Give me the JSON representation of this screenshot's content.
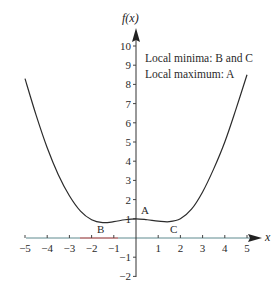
{
  "chart_data": {
    "type": "line",
    "title": "",
    "xlabel": "x",
    "ylabel": "f(x)",
    "xlim": [
      -5,
      5
    ],
    "ylim": [
      -2,
      10
    ],
    "grid": false,
    "x_ticks": [
      -5,
      -4,
      -3,
      -2,
      -1,
      1,
      2,
      3,
      4,
      5
    ],
    "x_tick_labels": [
      "−5",
      "−4",
      "−3",
      "−2",
      "−1",
      "1",
      "2",
      "3",
      "4",
      "5"
    ],
    "y_ticks": [
      -2,
      -1,
      1,
      2,
      3,
      4,
      5,
      6,
      7,
      8,
      9,
      10
    ],
    "y_tick_labels": [
      "−2",
      "−1",
      "1",
      "2",
      "3",
      "4",
      "5",
      "6",
      "7",
      "8",
      "9",
      "10"
    ],
    "series": [
      {
        "name": "f(x)",
        "x": [
          -5,
          -4.5,
          -4,
          -3.5,
          -3,
          -2.5,
          -2,
          -1.5,
          -1,
          -0.5,
          0,
          0.5,
          1,
          1.5,
          2,
          2.5,
          3,
          3.5,
          4,
          4.5,
          5
        ],
        "y": [
          8.3,
          6.4,
          4.7,
          3.3,
          2.2,
          1.4,
          0.95,
          0.8,
          0.85,
          0.95,
          1.0,
          0.95,
          0.88,
          0.85,
          1.0,
          1.5,
          2.4,
          3.6,
          5.0,
          6.7,
          8.5
        ]
      }
    ],
    "points": [
      {
        "label": "A",
        "x": 0,
        "y": 1,
        "type": "local maximum"
      },
      {
        "label": "B",
        "x": -1.5,
        "y": 0.8,
        "type": "local minimum"
      },
      {
        "label": "C",
        "x": 1.5,
        "y": 0.85,
        "type": "local minimum"
      }
    ],
    "annotations": [
      "Local minima: B and C",
      "Local maximum: A"
    ]
  },
  "labels": {
    "y_axis": "f(x)",
    "x_axis": "x",
    "note_line1": "Local minima: B and C",
    "note_line2": "Local maximum: A",
    "point_a": "A",
    "point_b": "B",
    "point_c": "C"
  },
  "colors": {
    "curve": "#2b2b2b",
    "axis": "#333333",
    "x_axis_tint": "#5f8a8f",
    "x_axis_red_segment": "#d65a5a"
  }
}
